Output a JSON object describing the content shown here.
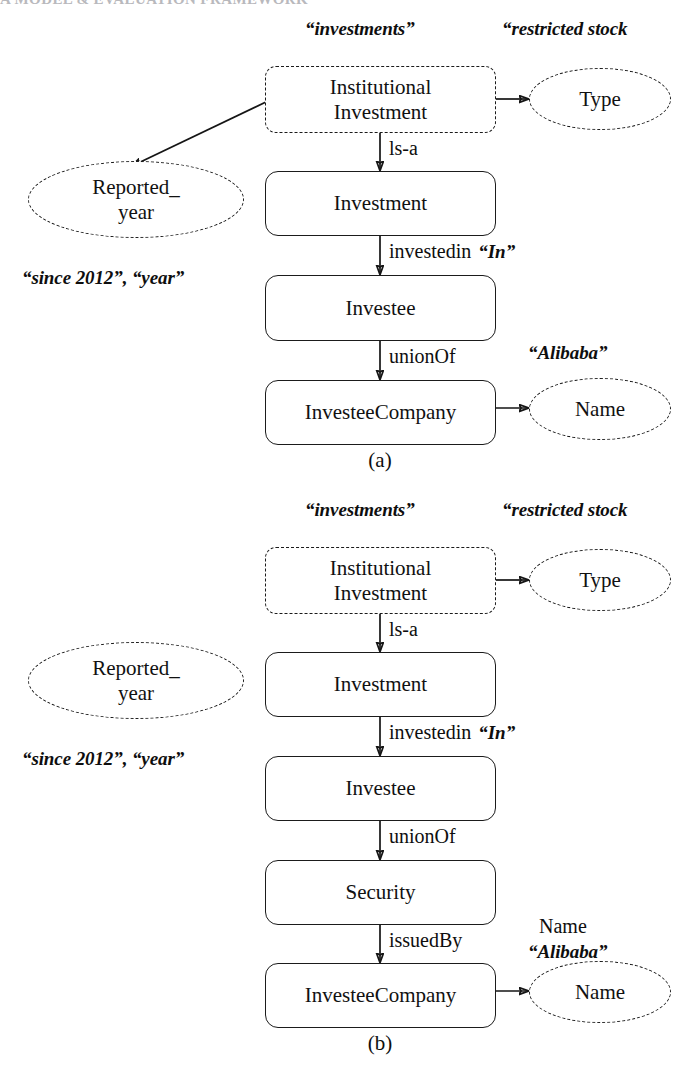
{
  "page": {
    "running_header": "A MODEL & EVALUATION FRAMEWORK",
    "background": "#ffffff",
    "ink": "#111111"
  },
  "figures": [
    {
      "id": "figure-a",
      "caption": "(a)",
      "nodes": [
        {
          "id": "a-institutional-investment",
          "label": "Institutional\nInvestment",
          "shape": "box",
          "style": "dashed"
        },
        {
          "id": "a-type",
          "label": "Type",
          "shape": "ellipse",
          "style": "dashed"
        },
        {
          "id": "a-reported-year",
          "label": "Reported_\nyear",
          "shape": "ellipse",
          "style": "dashed"
        },
        {
          "id": "a-investment",
          "label": "Investment",
          "shape": "box",
          "style": "solid"
        },
        {
          "id": "a-investee",
          "label": "Investee",
          "shape": "box",
          "style": "solid"
        },
        {
          "id": "a-investee-company",
          "label": "InvesteeCompany",
          "shape": "box",
          "style": "solid"
        },
        {
          "id": "a-name",
          "label": "Name",
          "shape": "ellipse",
          "style": "dashed"
        }
      ],
      "edges": [
        {
          "id": "a-edge-is-a",
          "from": "a-institutional-investment",
          "to": "a-investment",
          "label": "ls-a"
        },
        {
          "id": "a-edge-investedin",
          "from": "a-investment",
          "to": "a-investee",
          "label": "investedin",
          "literal": "“In”"
        },
        {
          "id": "a-edge-unionof",
          "from": "a-investee",
          "to": "a-investee-company",
          "label": "unionOf"
        },
        {
          "id": "a-edge-type",
          "from": "a-institutional-investment",
          "to": "a-type",
          "label": ""
        },
        {
          "id": "a-edge-name",
          "from": "a-investee-company",
          "to": "a-name",
          "label": ""
        },
        {
          "id": "a-edge-reported-year",
          "from": "a-institutional-investment",
          "to": "a-reported-year",
          "label": ""
        }
      ],
      "annotations": [
        {
          "id": "a-annot-investments",
          "text": "“investments”",
          "style": "quoted"
        },
        {
          "id": "a-annot-restricted-stock",
          "text": "“restricted stock",
          "style": "quoted"
        },
        {
          "id": "a-annot-since-2012",
          "text": "“since 2012”, “year”",
          "style": "quoted"
        },
        {
          "id": "a-annot-alibaba",
          "text": "“Alibaba”",
          "style": "quoted"
        }
      ]
    },
    {
      "id": "figure-b",
      "caption": "(b)",
      "nodes": [
        {
          "id": "b-institutional-investment",
          "label": "Institutional\nInvestment",
          "shape": "box",
          "style": "dashed"
        },
        {
          "id": "b-type",
          "label": "Type",
          "shape": "ellipse",
          "style": "dashed"
        },
        {
          "id": "b-reported-year",
          "label": "Reported_\nyear",
          "shape": "ellipse",
          "style": "dashed"
        },
        {
          "id": "b-investment",
          "label": "Investment",
          "shape": "box",
          "style": "solid"
        },
        {
          "id": "b-investee",
          "label": "Investee",
          "shape": "box",
          "style": "solid"
        },
        {
          "id": "b-security",
          "label": "Security",
          "shape": "box",
          "style": "solid"
        },
        {
          "id": "b-investee-company",
          "label": "InvesteeCompany",
          "shape": "box",
          "style": "solid"
        },
        {
          "id": "b-name",
          "label": "Name",
          "shape": "ellipse",
          "style": "dashed"
        }
      ],
      "edges": [
        {
          "id": "b-edge-is-a",
          "from": "b-institutional-investment",
          "to": "b-investment",
          "label": "ls-a"
        },
        {
          "id": "b-edge-investedin",
          "from": "b-investment",
          "to": "b-investee",
          "label": "investedin",
          "literal": "“In”"
        },
        {
          "id": "b-edge-unionof",
          "from": "b-investee",
          "to": "b-security",
          "label": "unionOf"
        },
        {
          "id": "b-edge-issuedby",
          "from": "b-security",
          "to": "b-investee-company",
          "label": "issuedBy"
        },
        {
          "id": "b-edge-type",
          "from": "b-institutional-investment",
          "to": "b-type",
          "label": ""
        },
        {
          "id": "b-edge-name",
          "from": "b-investee-company",
          "to": "b-name",
          "label": ""
        }
      ],
      "annotations": [
        {
          "id": "b-annot-investments",
          "text": "“investments”",
          "style": "quoted"
        },
        {
          "id": "b-annot-restricted-stock",
          "text": "“restricted stock",
          "style": "quoted"
        },
        {
          "id": "b-annot-since-2012",
          "text": "“since 2012”, “year”",
          "style": "quoted"
        },
        {
          "id": "b-annot-name-plain",
          "text": "Name",
          "style": "plain"
        },
        {
          "id": "b-annot-alibaba",
          "text": "“Alibaba”",
          "style": "quoted"
        }
      ]
    }
  ]
}
